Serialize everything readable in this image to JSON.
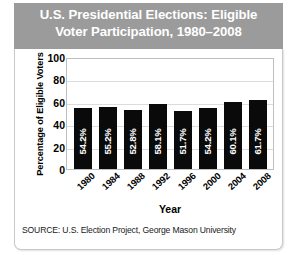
{
  "header": {
    "title": "U.S. Presidential Elections: Eligible\nVoter Participation, 1980–2008",
    "band_color": "#9b9b9b",
    "text_color": "#ffffff"
  },
  "source": {
    "text": "SOURCE: U.S. Election Project, George Mason University"
  },
  "chart_data": {
    "type": "bar",
    "title": "U.S. Presidential Elections: Eligible Voter Participation, 1980–2008",
    "subtitle": "",
    "categories": [
      "1980",
      "1984",
      "1988",
      "1992",
      "1996",
      "2000",
      "2004",
      "2008"
    ],
    "values": [
      54.2,
      55.2,
      52.8,
      58.1,
      51.7,
      54.2,
      60.1,
      61.7
    ],
    "data_labels": [
      "54.2%",
      "55.2%",
      "52.8%",
      "58.1%",
      "51.7%",
      "54.2%",
      "60.1%",
      "61.7%"
    ],
    "xlabel": "Year",
    "ylabel": "Percentage of Eligible Voters",
    "ylim": [
      0,
      100
    ],
    "yticks": [
      100,
      80,
      60,
      40,
      20,
      0
    ],
    "ytick_labels": [
      "100",
      "80",
      "60",
      "40",
      "20",
      "0"
    ],
    "grid": true,
    "grid_axis": "y",
    "legend": false,
    "bar_color": "#0a0a0a",
    "label_color": "#ffffff",
    "plot_background": "#ffffff",
    "gridline_color": "#dcdcdc"
  }
}
